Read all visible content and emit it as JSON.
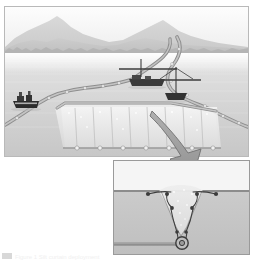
{
  "figure": {
    "type": "technical-illustration",
    "style": "grayscale halftone",
    "caption": "Figure 1  Silt curtain deployment"
  },
  "colors": {
    "sky": "#fbfbfb",
    "mountain_far": "#d6d6d6",
    "mountain_near": "#c4c4c4",
    "treeline": "#b5b5b5",
    "water": "#d5d5d5",
    "water_highlight": "#ededed",
    "turbid_zone": "#e9e9e9",
    "boom_float": "#a8a8a8",
    "boom_line": "#7d7d7d",
    "vessel_hull": "#2e2e2e",
    "arrow": "#9e9e9e",
    "arrow_outline": "#6f6f6f",
    "frame_border": "#b9b9b9",
    "inset_border": "#9a9a9a",
    "seabed": "#c5c5c5",
    "pipeline": "#8a8a8a",
    "plume": "#e4e4e4",
    "detail_line": "#4a4a4a"
  },
  "main_panel": {
    "name": "Main scene: estuary with silt curtain enclosure",
    "background": {
      "sky_label": "sky",
      "mountains_label": "distant mountain range",
      "treeline_label": "shoreline treeline",
      "water_label": "estuary water surface"
    },
    "elements": [
      {
        "id": "curtain-north",
        "label": "Silt curtain (north leg)",
        "type": "boom"
      },
      {
        "id": "curtain-channel",
        "label": "Silt curtain (channel leg)",
        "type": "boom"
      },
      {
        "id": "curtain-east",
        "label": "Silt curtain (east leg)",
        "type": "boom"
      },
      {
        "id": "curtain-enclosure",
        "label": "Silt curtain enclosure (skirted)",
        "type": "boom-skirt"
      },
      {
        "id": "turbid-zone",
        "label": "Contained turbidity plume",
        "type": "zone"
      },
      {
        "id": "tug-left",
        "label": "Work tug / anchor handler",
        "type": "vessel"
      },
      {
        "id": "barge-center",
        "label": "Dredge barge",
        "type": "vessel"
      },
      {
        "id": "support-right",
        "label": "Support vessel with derrick",
        "type": "vessel"
      }
    ],
    "vessel_count": 3,
    "skirt_panel_count": 8
  },
  "connector": {
    "name": "Curved arrow linking main scene to detail inset",
    "label": "detail-arrow",
    "direction": "down-right"
  },
  "inset_panel": {
    "name": "Cross-section detail: seabed trenching and sediment dispersion",
    "elements": [
      {
        "id": "waterline",
        "label": "Water / seabed interface",
        "type": "line"
      },
      {
        "id": "plume-funnel",
        "label": "Suspended sediment plume",
        "type": "plume"
      },
      {
        "id": "trench",
        "label": "Excavated trench (V-section)",
        "type": "trench"
      },
      {
        "id": "cutter-head",
        "label": "Cutter / jetting head",
        "type": "tool"
      },
      {
        "id": "pipeline",
        "label": "Buried pipeline",
        "type": "pipeline"
      },
      {
        "id": "flow-arrows",
        "label": "Sediment dispersion flow arrows",
        "type": "arrows"
      }
    ],
    "arrow_count": 6
  }
}
